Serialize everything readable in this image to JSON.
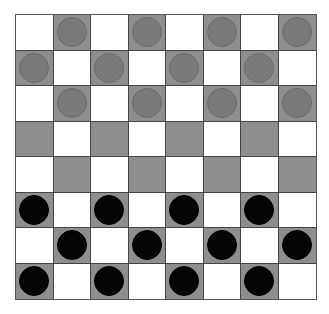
{
  "board": {
    "rows": 8,
    "cols": 8,
    "colors": {
      "light": "#ffffff",
      "dark": "#8e8e8e",
      "grey_piece": "#7a7a7a",
      "black_piece": "#050505"
    },
    "pieces": [
      [
        "",
        "grey",
        "",
        "grey",
        "",
        "grey",
        "",
        "grey"
      ],
      [
        "grey",
        "",
        "grey",
        "",
        "grey",
        "",
        "grey",
        ""
      ],
      [
        "",
        "grey",
        "",
        "grey",
        "",
        "grey",
        "",
        "grey"
      ],
      [
        "",
        "",
        "",
        "",
        "",
        "",
        "",
        ""
      ],
      [
        "",
        "",
        "",
        "",
        "",
        "",
        "",
        ""
      ],
      [
        "black",
        "",
        "black",
        "",
        "black",
        "",
        "black",
        ""
      ],
      [
        "",
        "black",
        "",
        "black",
        "",
        "black",
        "",
        "black"
      ],
      [
        "black",
        "",
        "black",
        "",
        "black",
        "",
        "black",
        ""
      ]
    ]
  }
}
